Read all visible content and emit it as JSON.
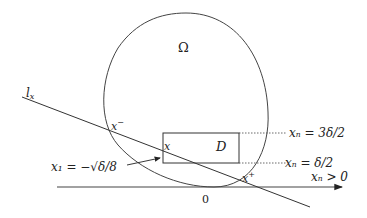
{
  "figure": {
    "region_label": "Ω",
    "line_label_main": "l",
    "line_label_sub": "x",
    "box_label": "D",
    "point_x": "x",
    "point_xminus_main": "x",
    "point_xminus_sup": "−",
    "point_xplus_main": "x",
    "point_xplus_sup": "+",
    "origin_label": "0",
    "annotation_x1": "x₁ = −√δ/8",
    "annotation_upper": "xₙ = 3δ/2",
    "annotation_lower": "xₙ = δ/2",
    "annotation_halfspace": "xₙ > 0"
  },
  "colors": {
    "stroke": "#333333",
    "text": "#222222",
    "background": "#ffffff"
  }
}
